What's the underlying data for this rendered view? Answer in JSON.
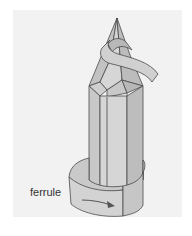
{
  "diagram": {
    "labels": {
      "ferrule": "ferrule"
    },
    "colors": {
      "background": "#ffffff",
      "panel": "#f2f2f2",
      "face_light": "#d4d4d4",
      "face_mid": "#c4c4c4",
      "face_dark": "#b5b5b5",
      "paper_strip": "#cfcfcf",
      "outline": "#4a4a4a",
      "arrow": "#555555"
    },
    "arrow": {
      "direction": "right",
      "meaning": "ferrule wraps around pencil end"
    }
  }
}
